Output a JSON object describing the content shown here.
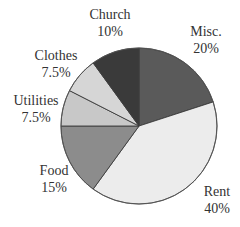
{
  "chart_data": {
    "type": "pie",
    "title": "",
    "start_angle_deg": 0,
    "direction": "clockwise",
    "slices": [
      {
        "label": "Misc.",
        "value": 20,
        "display": "20%",
        "color": "#5a5a5a"
      },
      {
        "label": "Rent",
        "value": 40,
        "display": "40%",
        "color": "#ececec"
      },
      {
        "label": "Food",
        "value": 15,
        "display": "15%",
        "color": "#8c8c8c"
      },
      {
        "label": "Utilities",
        "value": 7.5,
        "display": "7.5%",
        "color": "#c8c8c8"
      },
      {
        "label": "Clothes",
        "value": 7.5,
        "display": "7.5%",
        "color": "#d6d6d6"
      },
      {
        "label": "Church",
        "value": 10,
        "display": "10%",
        "color": "#3a3a3a"
      }
    ],
    "legend": "none (labels placed outside slices)"
  },
  "labels": {
    "misc": {
      "name": "Misc.",
      "pct": "20%"
    },
    "rent": {
      "name": "Rent",
      "pct": "40%"
    },
    "food": {
      "name": "Food",
      "pct": "15%"
    },
    "utilities": {
      "name": "Utilities",
      "pct": "7.5%"
    },
    "clothes": {
      "name": "Clothes",
      "pct": "7.5%"
    },
    "church": {
      "name": "Church",
      "pct": "10%"
    }
  }
}
